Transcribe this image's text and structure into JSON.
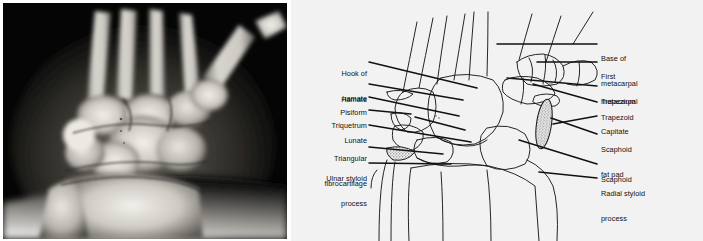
{
  "figure": {
    "type": "medical-illustration",
    "panels": [
      {
        "id": "xray",
        "kind": "radiograph",
        "description": "Posteroanterior wrist radiograph"
      },
      {
        "id": "diagram",
        "kind": "line-drawing",
        "description": "Labelled line diagram of the wrist bones"
      }
    ],
    "colors": {
      "diagram_background": "#f2f2f2",
      "xray_background": "#000000",
      "ink": "#111111",
      "page_background": "#ffffff"
    }
  },
  "labels_left": [
    {
      "id": "hook-of-hamate",
      "line1": "Hook of",
      "line2": "hamate"
    },
    {
      "id": "hamate",
      "line1": "Hamate",
      "line2": ""
    },
    {
      "id": "pisiform",
      "line1": "Pisiform",
      "line2": ""
    },
    {
      "id": "triquetrum",
      "line1": "Triquetrum",
      "line2": ""
    },
    {
      "id": "lunate",
      "line1": "Lunate",
      "line2": ""
    },
    {
      "id": "triangular-fibrocartilage",
      "line1": "Triangular",
      "line2": "fibrocartilage"
    },
    {
      "id": "ulnar-styloid-process",
      "line1": "Ulnar styloid",
      "line2": "process"
    }
  ],
  "labels_right": [
    {
      "id": "base-of-metacarpal",
      "line1": "Base of",
      "line2": "metacarpal"
    },
    {
      "id": "first-metacarpal",
      "line1": "First",
      "line2": "metacarpal"
    },
    {
      "id": "trapezium",
      "line1": "Trapezium",
      "line2": ""
    },
    {
      "id": "trapezoid",
      "line1": "Trapezoid",
      "line2": ""
    },
    {
      "id": "capitate",
      "line1": "Capitate",
      "line2": ""
    },
    {
      "id": "scaphoid-fat-pad",
      "line1": "Scaphoid",
      "line2": "fat pad"
    },
    {
      "id": "scaphoid",
      "line1": "Scaphoid",
      "line2": ""
    },
    {
      "id": "radial-styloid-process",
      "line1": "Radial styloid",
      "line2": "process"
    }
  ]
}
